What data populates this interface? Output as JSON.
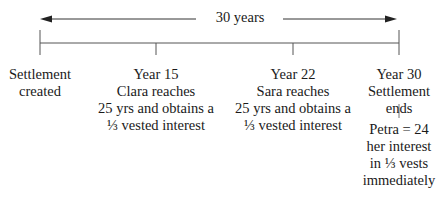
{
  "diagram": {
    "type": "timeline",
    "span_label": "30 years",
    "events": [
      {
        "id": "start",
        "lines": [
          "Settlement",
          "created"
        ]
      },
      {
        "id": "year15",
        "lines": [
          "Year 15",
          "Clara reaches",
          "25 yrs and obtains a",
          "⅓ vested interest"
        ]
      },
      {
        "id": "year22",
        "lines": [
          "Year 22",
          "Sara reaches",
          "25 yrs and obtains a",
          "⅓ vested interest"
        ]
      },
      {
        "id": "year30",
        "lines": [
          "Year 30",
          "Settlement",
          "ends"
        ]
      }
    ],
    "footnote": {
      "lines": [
        "Petra = 24",
        "her interest",
        "in ⅓ vests",
        "immediately"
      ]
    }
  }
}
